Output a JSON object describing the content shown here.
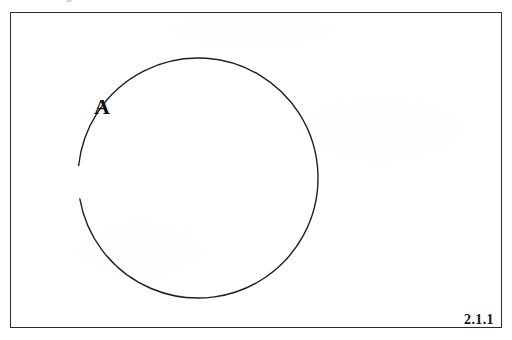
{
  "figure": {
    "header_text": "Venn diagram",
    "frame": {
      "border_color": "#2b2b2f",
      "background_color": "#ffffff"
    },
    "figure_number": "2.1.1",
    "background_color": "#ffffff",
    "stroke_color": "#1e1e22"
  },
  "diagram": {
    "type": "venn-diagram",
    "set_count": 1,
    "universe_shape": "rectangle",
    "circle": {
      "label": "A",
      "center_x": 198,
      "center_y": 178,
      "radius": 120,
      "stroke_color": "#1e1e22",
      "stroke_width": 1.4,
      "fill": "none",
      "label_gap_present": true
    },
    "labels": [
      {
        "text": "A",
        "x": 95,
        "y": 99,
        "style": "bold-serif"
      }
    ]
  }
}
